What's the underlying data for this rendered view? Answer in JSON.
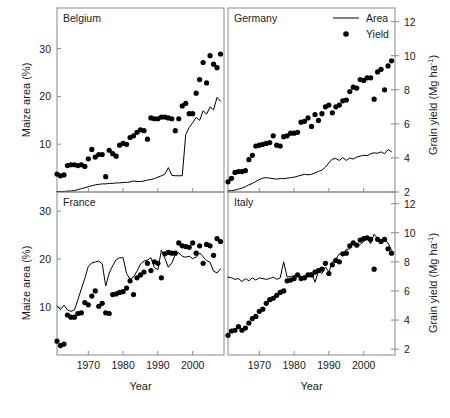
{
  "figure": {
    "axis_titles": {
      "left": "Maize area (%)",
      "right": "Grain yield (Mg ha-1)",
      "right_base": "Grain yield (Mg ha",
      "right_sup": "-1",
      "right_close": ")",
      "bottom": "Year"
    },
    "legend": {
      "position": "top-right of Germany panel",
      "items": [
        {
          "label": "Area",
          "marker": "line",
          "color": "#000000"
        },
        {
          "label": "Yield",
          "marker": "dot",
          "color": "#000000"
        }
      ]
    }
  },
  "chart_data": [
    {
      "type": "line",
      "title": "Belgium",
      "panel": "top-left",
      "xlabel": "Year",
      "ylabel": "Maize area (%)",
      "xlim": [
        1961,
        2009
      ],
      "ylim": [
        0,
        38.5
      ],
      "xticks": [
        1970,
        1980,
        1990,
        2000
      ],
      "yticks": [
        10,
        20,
        30
      ],
      "y2lim": [
        2,
        12.8
      ],
      "y2ticks": [],
      "grid": false,
      "series": [
        {
          "name": "Area",
          "marker": "line",
          "axis": "left",
          "x": [
            1961,
            1962,
            1963,
            1964,
            1965,
            1966,
            1967,
            1968,
            1969,
            1970,
            1971,
            1972,
            1973,
            1974,
            1975,
            1976,
            1977,
            1978,
            1979,
            1980,
            1981,
            1982,
            1983,
            1984,
            1985,
            1986,
            1987,
            1988,
            1989,
            1990,
            1991,
            1992,
            1993,
            1994,
            1995,
            1996,
            1997,
            1998,
            1999,
            2000,
            2001,
            2002,
            2003,
            2004,
            2005,
            2006,
            2007,
            2008
          ],
          "values": [
            0.1,
            0.1,
            0.1,
            0.2,
            0.2,
            0.3,
            0.5,
            0.7,
            0.9,
            1.1,
            1.3,
            1.5,
            1.6,
            1.7,
            1.7,
            1.8,
            1.8,
            1.9,
            1.9,
            2.0,
            2.0,
            2.1,
            2.3,
            2.2,
            2.2,
            2.3,
            2.5,
            2.6,
            2.8,
            3.1,
            3.4,
            3.7,
            5.1,
            3.5,
            3.4,
            3.4,
            3.4,
            12.0,
            13.5,
            14.5,
            15.6,
            15.0,
            17.0,
            16.3,
            17.8,
            17.2,
            19.8,
            19.0
          ]
        },
        {
          "name": "Yield",
          "marker": "dot",
          "axis": "right",
          "x": [
            1961,
            1962,
            1963,
            1964,
            1965,
            1966,
            1967,
            1968,
            1969,
            1970,
            1971,
            1972,
            1973,
            1974,
            1975,
            1976,
            1977,
            1978,
            1979,
            1980,
            1981,
            1982,
            1983,
            1984,
            1985,
            1986,
            1987,
            1988,
            1989,
            1990,
            1991,
            1992,
            1993,
            1994,
            1995,
            1996,
            1997,
            1998,
            1999,
            2000,
            2001,
            2002,
            2003,
            2004,
            2005,
            2006,
            2007,
            2008
          ],
          "values": [
            3.05,
            2.95,
            3.0,
            3.55,
            3.6,
            3.6,
            3.55,
            3.6,
            3.5,
            3.95,
            4.5,
            4.05,
            4.2,
            4.2,
            2.9,
            4.45,
            4.25,
            4.1,
            4.75,
            4.85,
            4.8,
            5.2,
            5.3,
            5.5,
            5.65,
            5.6,
            5.1,
            6.35,
            6.3,
            6.3,
            6.4,
            6.4,
            6.35,
            6.3,
            5.6,
            6.3,
            7.05,
            7.2,
            6.6,
            6.6,
            7.8,
            8.6,
            9.6,
            8.4,
            10.0,
            9.5,
            9.3,
            10.1
          ]
        }
      ]
    },
    {
      "type": "line",
      "title": "Germany",
      "panel": "top-right",
      "xlabel": "Year",
      "ylabel": "Grain yield (Mg ha-1)",
      "xlim": [
        1961,
        2009
      ],
      "ylim": [
        0,
        38.5
      ],
      "xticks": [
        1970,
        1980,
        1990,
        2000
      ],
      "yticks": [],
      "y2lim": [
        2,
        12.8
      ],
      "y2ticks": [
        2,
        4,
        6,
        8,
        10,
        12
      ],
      "grid": false,
      "series": [
        {
          "name": "Area",
          "marker": "line",
          "axis": "left",
          "x": [
            1961,
            1962,
            1963,
            1964,
            1965,
            1966,
            1967,
            1968,
            1969,
            1970,
            1971,
            1972,
            1973,
            1974,
            1975,
            1976,
            1977,
            1978,
            1979,
            1980,
            1981,
            1982,
            1983,
            1984,
            1985,
            1986,
            1987,
            1988,
            1989,
            1990,
            1991,
            1992,
            1993,
            1994,
            1995,
            1996,
            1997,
            1998,
            1999,
            2000,
            2001,
            2002,
            2003,
            2004,
            2005,
            2006,
            2007,
            2008
          ],
          "values": [
            0.2,
            0.3,
            0.4,
            0.6,
            0.8,
            1.1,
            1.5,
            1.8,
            2.2,
            2.6,
            2.9,
            3.0,
            2.9,
            2.8,
            2.7,
            2.8,
            2.8,
            2.9,
            3.0,
            3.1,
            3.3,
            3.5,
            3.7,
            3.6,
            3.7,
            4.0,
            4.3,
            4.6,
            5.2,
            6.1,
            6.9,
            7.0,
            6.6,
            7.2,
            6.6,
            7.1,
            6.9,
            7.3,
            7.5,
            7.7,
            7.6,
            8.0,
            8.2,
            8.1,
            8.4,
            8.0,
            8.9,
            8.4
          ]
        },
        {
          "name": "Yield",
          "marker": "dot",
          "axis": "right",
          "x": [
            1961,
            1962,
            1963,
            1964,
            1965,
            1966,
            1967,
            1968,
            1969,
            1970,
            1971,
            1972,
            1973,
            1974,
            1975,
            1976,
            1977,
            1978,
            1979,
            1980,
            1981,
            1982,
            1983,
            1984,
            1985,
            1986,
            1987,
            1988,
            1989,
            1990,
            1991,
            1992,
            1993,
            1994,
            1995,
            1996,
            1997,
            1998,
            1999,
            2000,
            2001,
            2002,
            2003,
            2004,
            2005,
            2006,
            2007,
            2008
          ],
          "values": [
            2.6,
            2.8,
            3.15,
            3.2,
            3.2,
            3.25,
            3.9,
            4.15,
            4.7,
            4.75,
            4.8,
            4.85,
            4.9,
            5.3,
            4.75,
            4.7,
            5.25,
            5.3,
            5.45,
            5.45,
            5.5,
            6.1,
            6.15,
            6.35,
            5.85,
            6.55,
            6.2,
            6.6,
            7.0,
            7.1,
            6.65,
            7.0,
            7.1,
            7.35,
            7.4,
            7.9,
            8.15,
            8.1,
            8.6,
            8.55,
            8.7,
            8.7,
            7.45,
            9.05,
            9.2,
            8.0,
            9.4,
            9.7
          ]
        }
      ]
    },
    {
      "type": "line",
      "title": "France",
      "panel": "bottom-left",
      "xlabel": "Year",
      "ylabel": "Maize area (%)",
      "xlim": [
        1961,
        2009
      ],
      "ylim": [
        0,
        34
      ],
      "xticks": [
        1970,
        1980,
        1990,
        2000
      ],
      "yticks": [
        10,
        20,
        30
      ],
      "y2lim": [
        1.6,
        12.8
      ],
      "y2ticks": [],
      "grid": false,
      "series": [
        {
          "name": "Area",
          "marker": "line",
          "axis": "left",
          "x": [
            1961,
            1962,
            1963,
            1964,
            1965,
            1966,
            1967,
            1968,
            1969,
            1970,
            1971,
            1972,
            1973,
            1974,
            1975,
            1976,
            1977,
            1978,
            1979,
            1980,
            1981,
            1982,
            1983,
            1984,
            1985,
            1986,
            1987,
            1988,
            1989,
            1990,
            1991,
            1992,
            1993,
            1994,
            1995,
            1996,
            1997,
            1998,
            1999,
            2000,
            2001,
            2002,
            2003,
            2004,
            2005,
            2006,
            2007,
            2008
          ],
          "values": [
            10.2,
            9.5,
            10.4,
            9.4,
            9.1,
            9.4,
            11.5,
            13.8,
            16.0,
            18.5,
            19.2,
            19.4,
            19.6,
            19.0,
            14.4,
            17.1,
            18.6,
            19.9,
            20.3,
            20.3,
            17.0,
            15.8,
            16.3,
            17.5,
            19.0,
            19.6,
            19.8,
            20.3,
            18.2,
            17.8,
            21.9,
            20.2,
            18.3,
            19.2,
            21.0,
            21.3,
            20.6,
            20.4,
            20.6,
            20.1,
            20.4,
            21.3,
            20.5,
            19.7,
            19.3,
            17.5,
            17.1,
            18.0
          ]
        },
        {
          "name": "Yield",
          "marker": "dot",
          "axis": "right",
          "x": [
            1961,
            1962,
            1963,
            1964,
            1965,
            1966,
            1967,
            1968,
            1969,
            1970,
            1971,
            1972,
            1973,
            1974,
            1975,
            1976,
            1977,
            1978,
            1979,
            1980,
            1981,
            1982,
            1983,
            1984,
            1985,
            1986,
            1987,
            1988,
            1989,
            1990,
            1991,
            1992,
            1993,
            1994,
            1995,
            1996,
            1997,
            1998,
            1999,
            2000,
            2001,
            2002,
            2003,
            2004,
            2005,
            2006,
            2007,
            2008
          ],
          "values": [
            2.55,
            2.25,
            2.35,
            4.35,
            4.2,
            4.2,
            4.45,
            4.5,
            5.2,
            5.05,
            5.65,
            6.0,
            4.95,
            5.15,
            4.5,
            4.45,
            5.75,
            5.8,
            5.9,
            5.95,
            6.2,
            6.7,
            5.75,
            6.9,
            7.1,
            7.3,
            7.9,
            7.4,
            8.0,
            7.9,
            6.9,
            8.55,
            8.65,
            8.6,
            8.6,
            9.3,
            9.1,
            9.05,
            9.0,
            9.3,
            8.6,
            9.1,
            7.9,
            9.2,
            9.1,
            8.45,
            9.6,
            9.4
          ]
        }
      ]
    },
    {
      "type": "line",
      "title": "Italy",
      "panel": "bottom-right",
      "xlabel": "Year",
      "ylabel": "Grain yield (Mg ha-1)",
      "xlim": [
        1961,
        2009
      ],
      "ylim": [
        0,
        34
      ],
      "xticks": [
        1970,
        1980,
        1990,
        2000
      ],
      "yticks": [],
      "y2lim": [
        1.6,
        12.8
      ],
      "y2ticks": [
        2,
        4,
        6,
        8,
        10,
        12
      ],
      "grid": false,
      "series": [
        {
          "name": "Area",
          "marker": "line",
          "axis": "right",
          "x": [
            1961,
            1962,
            1963,
            1964,
            1965,
            1966,
            1967,
            1968,
            1969,
            1970,
            1971,
            1972,
            1973,
            1974,
            1975,
            1976,
            1977,
            1978,
            1979,
            1980,
            1981,
            1982,
            1983,
            1984,
            1985,
            1986,
            1987,
            1988,
            1989,
            1990,
            1991,
            1992,
            1993,
            1994,
            1995,
            1996,
            1997,
            1998,
            1999,
            2000,
            2001,
            2002,
            2003,
            2004,
            2005,
            2006,
            2007,
            2008
          ],
          "values": [
            6.95,
            6.9,
            6.8,
            6.85,
            6.65,
            6.85,
            6.7,
            6.9,
            6.75,
            6.9,
            6.85,
            6.8,
            6.85,
            6.95,
            6.8,
            6.9,
            8.0,
            6.95,
            7.0,
            7.05,
            7.15,
            7.0,
            7.0,
            7.2,
            7.25,
            6.6,
            7.35,
            7.2,
            7.65,
            7.3,
            8.0,
            8.2,
            8.55,
            8.5,
            8.85,
            8.9,
            9.35,
            9.0,
            9.2,
            9.4,
            9.6,
            9.25,
            9.9,
            9.6,
            9.4,
            9.5,
            9.3,
            8.8
          ]
        },
        {
          "name": "Yield",
          "marker": "dot",
          "axis": "right",
          "x": [
            1961,
            1962,
            1963,
            1964,
            1965,
            1966,
            1967,
            1968,
            1969,
            1970,
            1971,
            1972,
            1973,
            1974,
            1975,
            1976,
            1977,
            1978,
            1979,
            1980,
            1981,
            1982,
            1983,
            1984,
            1985,
            1986,
            1987,
            1988,
            1989,
            1990,
            1991,
            1992,
            1993,
            1994,
            1995,
            1996,
            1997,
            1998,
            1999,
            2000,
            2001,
            2002,
            2003,
            2004,
            2005,
            2006,
            2007,
            2008
          ],
          "values": [
            2.95,
            3.25,
            3.3,
            3.55,
            3.3,
            3.45,
            3.8,
            4.1,
            4.25,
            4.6,
            4.75,
            5.15,
            5.4,
            5.5,
            5.7,
            5.9,
            6.0,
            6.7,
            6.75,
            6.85,
            7.1,
            6.85,
            6.9,
            7.1,
            7.1,
            7.3,
            7.4,
            7.5,
            7.9,
            7.2,
            7.8,
            8.1,
            8.0,
            8.55,
            8.6,
            9.1,
            9.3,
            9.15,
            9.5,
            9.6,
            9.65,
            9.55,
            7.5,
            9.55,
            9.4,
            9.55,
            8.9,
            8.6
          ]
        }
      ]
    }
  ]
}
